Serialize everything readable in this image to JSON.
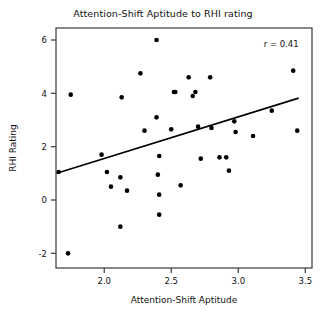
{
  "chart_data": {
    "type": "scatter",
    "title": "Attention-Shift Aptitude to RHI rating",
    "xlabel": "Attention-Shift Aptitude",
    "ylabel": "RHI Rating",
    "xlim": [
      1.64,
      3.55
    ],
    "ylim": [
      -2.55,
      6.45
    ],
    "xticks": [
      2.0,
      2.5,
      3.0,
      3.5
    ],
    "xticklabels": [
      "2.0",
      "2.5",
      "3.0",
      "3.5"
    ],
    "yticks": [
      -2,
      0,
      2,
      4,
      6
    ],
    "yticklabels": [
      "-2",
      "0",
      "2",
      "4",
      "6"
    ],
    "grid": false,
    "legend": null,
    "annotations": [
      {
        "text": "r = 0.41",
        "x": 3.32,
        "y": 5.75
      }
    ],
    "marker": {
      "shape": "circle",
      "color": "#000000",
      "size": 4.6
    },
    "points": [
      {
        "x": 1.75,
        "y": 3.95
      },
      {
        "x": 1.73,
        "y": -2.0
      },
      {
        "x": 1.66,
        "y": 1.05
      },
      {
        "x": 1.98,
        "y": 1.7
      },
      {
        "x": 2.02,
        "y": 1.05
      },
      {
        "x": 2.05,
        "y": 0.5
      },
      {
        "x": 2.13,
        "y": 3.85
      },
      {
        "x": 2.12,
        "y": 0.85
      },
      {
        "x": 2.12,
        "y": -1.0
      },
      {
        "x": 2.17,
        "y": 0.35
      },
      {
        "x": 2.27,
        "y": 4.75
      },
      {
        "x": 2.3,
        "y": 2.6
      },
      {
        "x": 2.39,
        "y": 6.0
      },
      {
        "x": 2.39,
        "y": 3.1
      },
      {
        "x": 2.41,
        "y": 1.65
      },
      {
        "x": 2.4,
        "y": 0.95
      },
      {
        "x": 2.41,
        "y": 0.2
      },
      {
        "x": 2.41,
        "y": -0.55
      },
      {
        "x": 2.52,
        "y": 4.05
      },
      {
        "x": 2.53,
        "y": 4.05
      },
      {
        "x": 2.5,
        "y": 2.65
      },
      {
        "x": 2.57,
        "y": 0.55
      },
      {
        "x": 2.63,
        "y": 4.6
      },
      {
        "x": 2.66,
        "y": 3.9
      },
      {
        "x": 2.68,
        "y": 4.05
      },
      {
        "x": 2.7,
        "y": 2.75
      },
      {
        "x": 2.72,
        "y": 1.55
      },
      {
        "x": 2.79,
        "y": 4.6
      },
      {
        "x": 2.8,
        "y": 2.7
      },
      {
        "x": 2.86,
        "y": 1.6
      },
      {
        "x": 2.91,
        "y": 1.6
      },
      {
        "x": 2.93,
        "y": 1.1
      },
      {
        "x": 2.97,
        "y": 2.95
      },
      {
        "x": 2.98,
        "y": 2.55
      },
      {
        "x": 3.11,
        "y": 2.4
      },
      {
        "x": 3.25,
        "y": 3.35
      },
      {
        "x": 3.41,
        "y": 4.85
      },
      {
        "x": 3.44,
        "y": 2.6
      }
    ],
    "fit_line": {
      "x0": 1.645,
      "y0": 1.0,
      "x1": 3.45,
      "y1": 3.82
    }
  }
}
